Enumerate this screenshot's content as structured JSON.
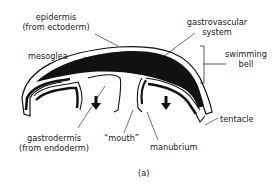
{
  "diagram": {
    "caption": "(a)",
    "labels": {
      "epidermis_line1": "epidermis",
      "epidermis_line2": "(from ectoderm)",
      "mesoglea": "mesoglea",
      "gastrovascular_line1": "gastrovascular",
      "gastrovascular_line2": "system",
      "swimming_bell_line1": "swimming",
      "swimming_bell_line2": "bell",
      "gastrodermis_line1": "gastrodermis",
      "gastrodermis_line2": "(from endoderm)",
      "mouth": "“mouth”",
      "manubrium": "manubrium",
      "tentacle": "tentacle"
    },
    "colors": {
      "ink": "#111111",
      "background": "#ffffff"
    },
    "arrows": [
      "down-arrow-left",
      "down-arrow-right"
    ]
  }
}
